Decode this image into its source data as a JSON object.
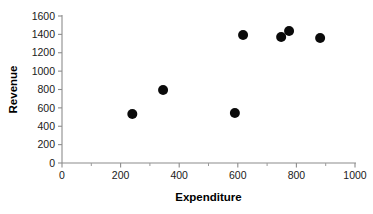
{
  "chart_data": {
    "type": "scatter",
    "title": "",
    "subtitle": "",
    "xlabel": "Expenditure",
    "ylabel": "Revenue",
    "xlim": [
      0,
      1000
    ],
    "ylim": [
      0,
      1600
    ],
    "xticks": [
      0,
      200,
      400,
      600,
      800,
      1000
    ],
    "yticks": [
      0,
      200,
      400,
      600,
      800,
      1000,
      1200,
      1400,
      1600
    ],
    "xtick_labels": [
      "0",
      "200",
      "400",
      "600",
      "800",
      "1000"
    ],
    "ytick_labels": [
      "0",
      "200",
      "400",
      "600",
      "800",
      "1000",
      "1200",
      "1400",
      "1600"
    ],
    "x_minor_tick_interval": 100,
    "grid": false,
    "legend": false,
    "legend_position": "none",
    "marker": {
      "shape": "circle",
      "color": "#0a0a0a",
      "radius_px": 5
    },
    "axis_color": "#8c8c8c",
    "background_color": "#ffffff",
    "points": [
      {
        "x": 240,
        "y": 533
      },
      {
        "x": 345,
        "y": 794
      },
      {
        "x": 590,
        "y": 544
      },
      {
        "x": 618,
        "y": 1393
      },
      {
        "x": 748,
        "y": 1371
      },
      {
        "x": 775,
        "y": 1436
      },
      {
        "x": 881,
        "y": 1360
      }
    ],
    "series": [
      {
        "name": "Revenue vs Expenditure",
        "x": [
          240,
          345,
          590,
          618,
          748,
          775,
          881
        ],
        "values": [
          533,
          794,
          544,
          1393,
          1371,
          1436,
          1360
        ]
      }
    ]
  },
  "labels": {
    "xlabel": "Expenditure",
    "ylabel": "Revenue"
  }
}
